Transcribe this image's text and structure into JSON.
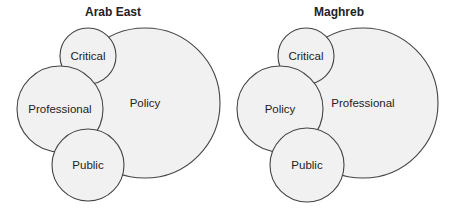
{
  "style": {
    "fill": "#f1f1f1",
    "stroke": "#444444"
  },
  "panels": [
    {
      "title": "Arab East",
      "circles": [
        {
          "label": "Policy",
          "cx": 145,
          "cy": 103,
          "r": 75
        },
        {
          "label": "Critical",
          "cx": 88,
          "cy": 56,
          "r": 28
        },
        {
          "label": "Professional",
          "cx": 60,
          "cy": 109,
          "r": 43
        },
        {
          "label": "Public",
          "cx": 88,
          "cy": 165,
          "r": 36
        }
      ]
    },
    {
      "title": "Maghreb",
      "circles": [
        {
          "label": "Professional",
          "cx": 137,
          "cy": 103,
          "r": 75
        },
        {
          "label": "Critical",
          "cx": 80,
          "cy": 56,
          "r": 28
        },
        {
          "label": "Policy",
          "cx": 54,
          "cy": 109,
          "r": 43
        },
        {
          "label": "Public",
          "cx": 81,
          "cy": 165,
          "r": 37
        }
      ]
    }
  ]
}
